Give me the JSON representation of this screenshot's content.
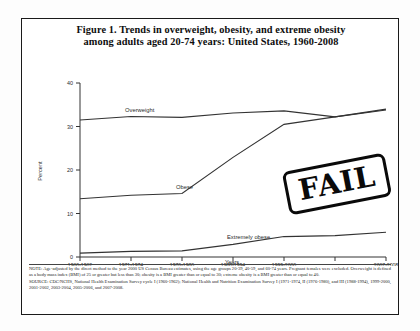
{
  "figure": {
    "title_line1": "Figure 1. Trends in overweight, obesity, and extreme obesity",
    "title_line2": "among adults aged 20-74 years: United States, 1960-2008"
  },
  "notes": {
    "note": "NOTE: Age-adjusted by the direct method to the year 2000 US Census Bureau estimates, using the age groups 20-39, 40-59, and 60-74 years. Pregnant females were excluded. Overweight is defined as a body mass index (BMI) of 25 or greater but less than 30; obesity is a BMI greater than or equal to 30; extreme obesity is a BMI greater than or equal to 40.",
    "source": "SOURCE: CDC/NCHS, National Health Examination Survey cycle I (1960-1962); National Health and Nutrition Examination Survey I (1971-1974, II (1976-1980), and III (1988-1994), 1999-2000, 2001-2002, 2003-2004, 2005-2006, and 2007-2008."
  },
  "stamp": {
    "label": "FAIL",
    "color": "#0a0a0a"
  },
  "chart_data": {
    "type": "line",
    "title": "Figure 1. Trends in overweight, obesity, and extreme obesity among adults aged 20-74 years: United States, 1960-2008",
    "xlabel": "Years",
    "ylabel": "Percent",
    "ylim": [
      0,
      40
    ],
    "yticks": [
      0,
      10,
      20,
      30,
      40
    ],
    "ytick_labels": [
      "0",
      "10",
      "20",
      "30",
      "40"
    ],
    "grid": false,
    "legend": "inline-labels",
    "categories": [
      "1960-1962",
      "1971-1974",
      "1976-1980",
      "1988-1994",
      "1999-2000",
      "2003-2004",
      "2007-2008"
    ],
    "xtick_labels_offset": [
      "2003-2004"
    ],
    "series": [
      {
        "name": "Overweight",
        "label": "Overweight",
        "values": [
          31.5,
          32.3,
          32.1,
          33.1,
          33.6,
          32.2,
          34.0
        ]
      },
      {
        "name": "Obese",
        "label": "Obese",
        "values": [
          13.4,
          14.2,
          14.6,
          22.9,
          30.5,
          32.2,
          33.8
        ]
      },
      {
        "name": "Extremely obese",
        "label": "Extremely obese",
        "values": [
          0.9,
          1.3,
          1.4,
          2.9,
          4.7,
          4.9,
          5.7
        ]
      }
    ]
  }
}
